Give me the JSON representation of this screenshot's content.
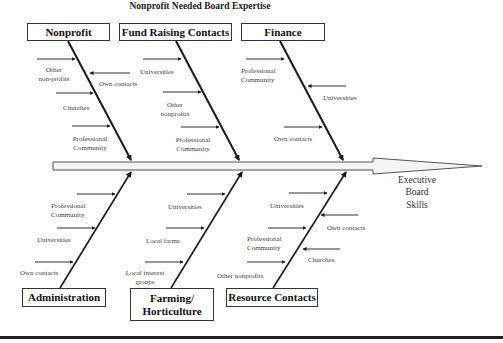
{
  "title": "Nonprofit Needed Board Expertise",
  "effect": {
    "line1": "Executive",
    "line2": "Board",
    "line3": "Skills"
  },
  "categories": {
    "top": [
      {
        "name": "Nonprofit",
        "causes": [
          {
            "text": [
              "Other",
              "non-profits"
            ],
            "direction": "right"
          },
          {
            "text": [
              "Own contacts"
            ],
            "direction": "left"
          },
          {
            "text": [
              "Churches"
            ],
            "direction": "right"
          },
          {
            "text": [
              "Professional",
              "Community"
            ],
            "direction": "right"
          }
        ]
      },
      {
        "name": "Fund Raising Contacts",
        "causes": [
          {
            "text": [
              "Universities"
            ],
            "direction": "right"
          },
          {
            "text": [
              "Other",
              "nonprofits"
            ],
            "direction": "right"
          },
          {
            "text": [
              "Professional",
              "Community"
            ],
            "direction": "right"
          }
        ]
      },
      {
        "name": "Finance",
        "causes": [
          {
            "text": [
              "Professional",
              "Community"
            ],
            "direction": "right"
          },
          {
            "text": [
              "Universities"
            ],
            "direction": "left"
          },
          {
            "text": [
              "Own contacts"
            ],
            "direction": "right"
          }
        ]
      }
    ],
    "bottom": [
      {
        "name": "Administration",
        "causes": [
          {
            "text": [
              "Professional",
              "Community"
            ],
            "direction": "right"
          },
          {
            "text": [
              "Universities"
            ],
            "direction": "right"
          },
          {
            "text": [
              "Own contacts"
            ],
            "direction": "right"
          }
        ]
      },
      {
        "name_line1": "Farming/",
        "name_line2": "Horticulture",
        "causes": [
          {
            "text": [
              "Universities"
            ],
            "direction": "right"
          },
          {
            "text": [
              "Local farms"
            ],
            "direction": "right"
          },
          {
            "text": [
              "Local interest",
              "groups"
            ],
            "direction": "right"
          }
        ]
      },
      {
        "name": "Resource Contacts",
        "causes": [
          {
            "text": [
              "Universities"
            ],
            "direction": "right"
          },
          {
            "text": [
              "Own contacts"
            ],
            "direction": "left"
          },
          {
            "text": [
              "Professional",
              "Community"
            ],
            "direction": "right"
          },
          {
            "text": [
              "Churches"
            ],
            "direction": "left"
          },
          {
            "text": [
              "Other nonprofits"
            ],
            "direction": "right"
          }
        ]
      }
    ]
  },
  "colors": {
    "line": "#1a1a1a",
    "spine_fill": "#f4f4f4",
    "text": "#444444"
  }
}
